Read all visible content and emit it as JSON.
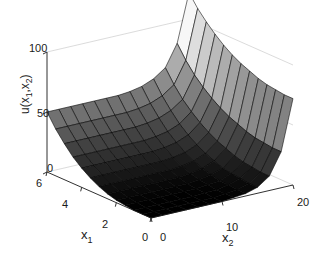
{
  "figure": {
    "type": "surface-plot-3d",
    "background_color": "#ffffff",
    "axis_line_color": "#cccccc",
    "tick_color": "#1a1a1a",
    "mesh_line_color": "#000000",
    "colormap": "gray"
  },
  "axes": {
    "z": {
      "label_html": "u(x<sub>1</sub>,x<sub>2</sub>)",
      "ticks": [
        "0",
        "50",
        "100"
      ],
      "tick_values": [
        0,
        50,
        100
      ],
      "range": [
        0,
        100
      ]
    },
    "x1": {
      "label_text": "x",
      "label_sub": "1",
      "ticks": [
        "6",
        "4",
        "2",
        "0"
      ],
      "tick_values": [
        6,
        4,
        2,
        0
      ],
      "range": [
        0,
        6
      ]
    },
    "x2": {
      "label_text": "x",
      "label_sub": "2",
      "ticks": [
        "0",
        "10",
        "20"
      ],
      "tick_values": [
        0,
        10,
        20
      ],
      "range": [
        0,
        20
      ]
    }
  },
  "chart_data": {
    "type": "surface",
    "title": "",
    "xlabel": "x_1",
    "ylabel": "x_2",
    "zlabel": "u(x_1,x_2)",
    "xlim": [
      0,
      6
    ],
    "ylim": [
      0,
      20
    ],
    "zlim": [
      0,
      100
    ],
    "xticks": [
      0,
      2,
      4,
      6
    ],
    "yticks": [
      0,
      10,
      20
    ],
    "zticks": [
      0,
      50,
      100
    ],
    "grid": true,
    "legend": "none",
    "colormap": "gray",
    "colorbar": false,
    "view_azimuth": -37.5,
    "view_elevation": 30,
    "grid_nx": 13,
    "grid_ny": 13,
    "x": [
      0,
      0.5,
      1,
      1.5,
      2,
      2.5,
      3,
      3.5,
      4,
      4.5,
      5,
      5.5,
      6
    ],
    "y": [
      0,
      1.667,
      3.333,
      5,
      6.667,
      8.333,
      10,
      11.667,
      13.333,
      15,
      16.667,
      18.333,
      20
    ],
    "z": [
      [
        0,
        0,
        0,
        0,
        0,
        0,
        0,
        1,
        2,
        5,
        12,
        30,
        72
      ],
      [
        0,
        0,
        0,
        0,
        0,
        0,
        0,
        1,
        2,
        5,
        12,
        30,
        72
      ],
      [
        0,
        0,
        0,
        0,
        0,
        0,
        1,
        1,
        3,
        6,
        13,
        31,
        73
      ],
      [
        1,
        1,
        1,
        1,
        1,
        1,
        1,
        2,
        3,
        7,
        14,
        32,
        74
      ],
      [
        2,
        2,
        2,
        2,
        2,
        2,
        2,
        3,
        5,
        8,
        16,
        34,
        76
      ],
      [
        4,
        4,
        4,
        4,
        4,
        4,
        4,
        5,
        7,
        11,
        19,
        37,
        79
      ],
      [
        7,
        7,
        7,
        7,
        7,
        7,
        7,
        8,
        10,
        14,
        22,
        40,
        82
      ],
      [
        11,
        11,
        11,
        11,
        11,
        11,
        11,
        12,
        14,
        18,
        26,
        44,
        86
      ],
      [
        16,
        16,
        16,
        16,
        16,
        16,
        16,
        17,
        19,
        23,
        31,
        49,
        91
      ],
      [
        22,
        22,
        22,
        22,
        22,
        22,
        22,
        23,
        25,
        29,
        37,
        55,
        97
      ],
      [
        30,
        30,
        30,
        30,
        30,
        30,
        30,
        31,
        33,
        37,
        44,
        62,
        104
      ],
      [
        39,
        39,
        39,
        39,
        39,
        39,
        39,
        40,
        42,
        46,
        53,
        71,
        112
      ],
      [
        50,
        50,
        50,
        50,
        50,
        50,
        50,
        51,
        53,
        57,
        64,
        82,
        122
      ]
    ]
  },
  "tick_positions": {
    "z": [
      {
        "text": "100",
        "x": 29,
        "y": 43
      },
      {
        "text": "50",
        "x": 37,
        "y": 108
      },
      {
        "text": "0",
        "x": 47,
        "y": 163
      }
    ],
    "x1": [
      {
        "text": "6",
        "x": 36,
        "y": 178
      },
      {
        "text": "4",
        "x": 62,
        "y": 199
      },
      {
        "text": "2",
        "x": 102,
        "y": 219
      },
      {
        "text": "0",
        "x": 142,
        "y": 232
      }
    ],
    "x2": [
      {
        "text": "0",
        "x": 160,
        "y": 232
      },
      {
        "text": "10",
        "x": 226,
        "y": 222
      },
      {
        "text": "20",
        "x": 297,
        "y": 197
      }
    ]
  },
  "axis_title_positions": {
    "x1": {
      "x": 81,
      "y": 228
    },
    "x2": {
      "x": 222,
      "y": 231
    }
  }
}
